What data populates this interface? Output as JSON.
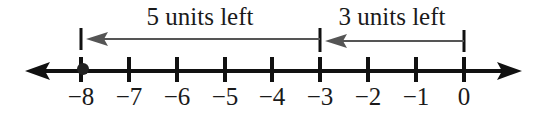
{
  "diagram": {
    "type": "number-line",
    "range": [
      -8,
      0
    ],
    "tick_labels": [
      "−8",
      "−7",
      "−6",
      "−5",
      "−4",
      "−3",
      "−2",
      "−1",
      "0"
    ],
    "ticks": [
      -8,
      -7,
      -6,
      -5,
      -4,
      -3,
      -2,
      -1,
      0
    ],
    "highlighted_point": -8,
    "moves": [
      {
        "label": "3 units left",
        "from": 0,
        "to": -3
      },
      {
        "label": "5 units left",
        "from": -3,
        "to": -8
      }
    ],
    "colors": {
      "axis": "#111111",
      "move_arrow": "#555555",
      "point": "#222222"
    }
  }
}
